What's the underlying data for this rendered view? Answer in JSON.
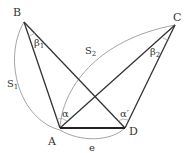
{
  "diagram": {
    "points": {
      "A": {
        "label": "A",
        "x": 60,
        "y": 128
      },
      "B": {
        "label": "B",
        "x": 24,
        "y": 22
      },
      "C": {
        "label": "C",
        "x": 175,
        "y": 25
      },
      "D": {
        "label": "D",
        "x": 125,
        "y": 128
      }
    },
    "labels": {
      "beta1": "β",
      "beta1_sub": "1",
      "beta2": "β",
      "beta2_sub": "2",
      "alpha": "α",
      "alpha_prime": "α′",
      "S1": "S",
      "S1_sub": "1",
      "S2": "S",
      "S2_sub": "2",
      "e": "e"
    },
    "colors": {
      "line": "#333333",
      "arc": "#999999"
    }
  }
}
